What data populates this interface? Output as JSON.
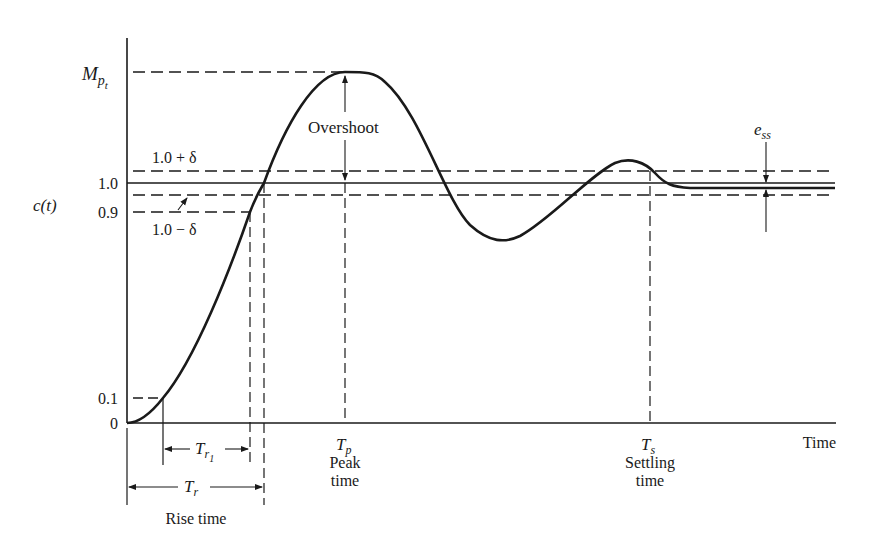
{
  "figure": {
    "y_axis_label": "c(t)",
    "x_axis_label": "Time",
    "y_ticks": [
      "0",
      "0.1",
      "0.9",
      "1.0"
    ],
    "levels": {
      "peak": "M",
      "peak_sub": "p",
      "peak_subsub": "t",
      "upper_band": "1.0 + δ",
      "lower_band": "1.0 − δ"
    },
    "annotations": {
      "overshoot": "Overshoot",
      "steady_state_error": "e",
      "steady_state_error_sub": "ss",
      "peak_time_symbol": "T",
      "peak_time_sub": "p",
      "peak_time_label_1": "Peak",
      "peak_time_label_2": "time",
      "settling_time_symbol": "T",
      "settling_time_sub": "s",
      "settling_time_label_1": "Settling",
      "settling_time_label_2": "time",
      "rise_time_1090_symbol": "T",
      "rise_time_1090_sub": "r",
      "rise_time_1090_subsub": "1",
      "rise_time_symbol": "T",
      "rise_time_sub": "r",
      "rise_time_label": "Rise time"
    },
    "colors": {
      "ink": "#1a1a1a",
      "background": "#ffffff"
    }
  }
}
